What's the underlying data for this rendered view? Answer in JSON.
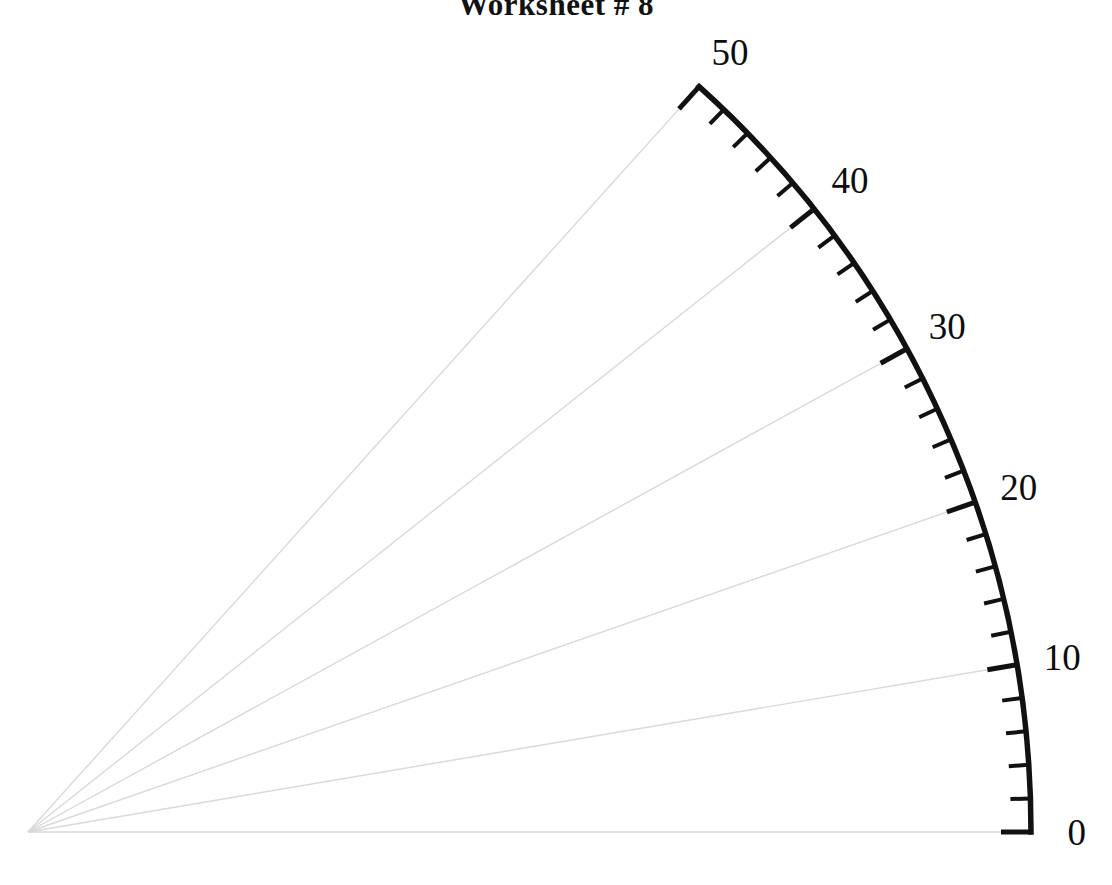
{
  "document": {
    "title": "Worksheet # 8",
    "title_clipped": true
  },
  "colors": {
    "arc": "#111111",
    "tick": "#111111",
    "radial_grid": "#d9d9d9",
    "label": "#0d0d0d",
    "background": "#ffffff"
  },
  "labels": {
    "l0": "0",
    "l10": "10",
    "l20": "20",
    "l30": "30",
    "l40": "40",
    "l50": "50"
  },
  "chart_data": {
    "type": "line",
    "title": "Worksheet # 8",
    "subtype": "polar-quadrant-scale",
    "xlabel": "",
    "ylabel": "",
    "grid": true,
    "legend": null,
    "apex": {
      "x": 28,
      "y": 832
    },
    "radius": 1003,
    "axis_range": [
      0,
      50
    ],
    "major_interval": 10,
    "minor_interval": 2,
    "angle_range_deg": [
      0,
      48
    ],
    "degrees_per_unit": 0.96,
    "categories": [
      "0",
      "10",
      "20",
      "30",
      "40",
      "50"
    ],
    "values": [
      0,
      10,
      20,
      30,
      40,
      50
    ],
    "series": [
      {
        "name": "arc scale",
        "ticks": [
          {
            "value": 0,
            "angle_deg": 0.0,
            "major": true,
            "label": "0"
          },
          {
            "value": 2,
            "angle_deg": 1.92,
            "major": false,
            "label": ""
          },
          {
            "value": 4,
            "angle_deg": 3.84,
            "major": false,
            "label": ""
          },
          {
            "value": 6,
            "angle_deg": 5.76,
            "major": false,
            "label": ""
          },
          {
            "value": 8,
            "angle_deg": 7.68,
            "major": false,
            "label": ""
          },
          {
            "value": 10,
            "angle_deg": 9.6,
            "major": true,
            "label": "10"
          },
          {
            "value": 12,
            "angle_deg": 11.52,
            "major": false,
            "label": ""
          },
          {
            "value": 14,
            "angle_deg": 13.44,
            "major": false,
            "label": ""
          },
          {
            "value": 16,
            "angle_deg": 15.36,
            "major": false,
            "label": ""
          },
          {
            "value": 18,
            "angle_deg": 17.28,
            "major": false,
            "label": ""
          },
          {
            "value": 20,
            "angle_deg": 19.2,
            "major": true,
            "label": "20"
          },
          {
            "value": 22,
            "angle_deg": 21.12,
            "major": false,
            "label": ""
          },
          {
            "value": 24,
            "angle_deg": 23.04,
            "major": false,
            "label": ""
          },
          {
            "value": 26,
            "angle_deg": 24.96,
            "major": false,
            "label": ""
          },
          {
            "value": 28,
            "angle_deg": 26.88,
            "major": false,
            "label": ""
          },
          {
            "value": 30,
            "angle_deg": 28.8,
            "major": true,
            "label": "30"
          },
          {
            "value": 32,
            "angle_deg": 30.72,
            "major": false,
            "label": ""
          },
          {
            "value": 34,
            "angle_deg": 32.64,
            "major": false,
            "label": ""
          },
          {
            "value": 36,
            "angle_deg": 34.56,
            "major": false,
            "label": ""
          },
          {
            "value": 38,
            "angle_deg": 36.48,
            "major": false,
            "label": ""
          },
          {
            "value": 40,
            "angle_deg": 38.4,
            "major": true,
            "label": "40"
          },
          {
            "value": 42,
            "angle_deg": 40.32,
            "major": false,
            "label": ""
          },
          {
            "value": 44,
            "angle_deg": 42.24,
            "major": false,
            "label": ""
          },
          {
            "value": 46,
            "angle_deg": 44.16,
            "major": false,
            "label": ""
          },
          {
            "value": 48,
            "angle_deg": 46.08,
            "major": false,
            "label": ""
          },
          {
            "value": 50,
            "angle_deg": 48.0,
            "major": true,
            "label": "50"
          }
        ]
      },
      {
        "name": "radial grid lines",
        "values": [
          0,
          10,
          20,
          30,
          40,
          50
        ]
      }
    ]
  }
}
